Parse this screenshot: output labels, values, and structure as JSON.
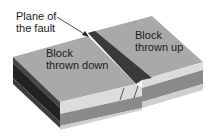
{
  "labels": {
    "plane_of_fault": [
      "Plane of",
      "the fault"
    ],
    "block_down": [
      "Block",
      "thrown down"
    ],
    "block_up": [
      "Block",
      "thrown up"
    ]
  },
  "colors": {
    "top_surface": "#a9a9a9",
    "fault_scarp": "#3a3a3a",
    "layer_light": "#d8d8d8",
    "layer_mid": "#8a8a8a",
    "side_dark": "#2a2a2a",
    "side_mid": "#555555",
    "arrow": "#222222"
  }
}
